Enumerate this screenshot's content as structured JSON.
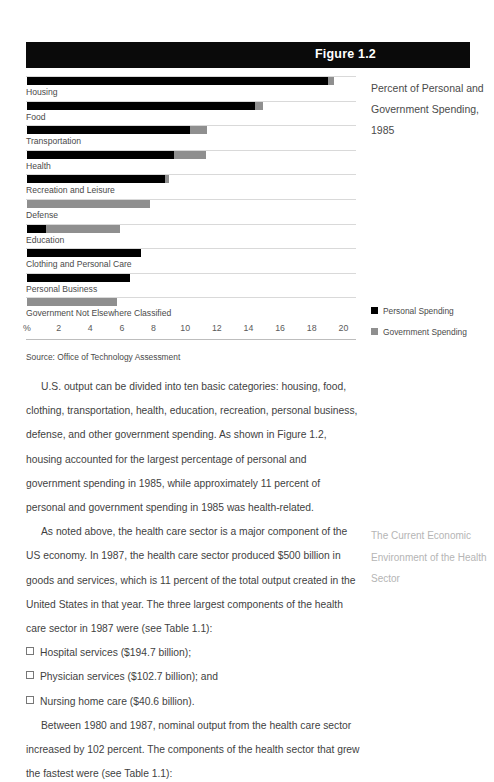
{
  "figure": {
    "header_label": "Figure 1.2",
    "caption": "Percent of Personal and Government Spending, 1985",
    "source": "Source: Office of Technology Assessment",
    "colors": {
      "personal": "#000000",
      "government": "#8f8f8f",
      "header_bar": "#0a0a0a",
      "rule": "#d9d9d9"
    },
    "legend": [
      {
        "label": "Personal Spending",
        "color": "#000000",
        "swatch": "square-swatch-personal"
      },
      {
        "label": "Government Spending",
        "color": "#8f8f8f",
        "swatch": "square-swatch-government"
      }
    ]
  },
  "chart_data": {
    "type": "bar",
    "orientation": "horizontal",
    "title": "Percent of Personal and Government Spending, 1985",
    "xlabel": "%",
    "ylabel": "",
    "xlim": [
      0,
      20
    ],
    "xticks": [
      "%",
      "2",
      "4",
      "6",
      "8",
      "10",
      "12",
      "14",
      "16",
      "18",
      "20"
    ],
    "xtick_values": [
      0,
      2,
      4,
      6,
      8,
      10,
      12,
      14,
      16,
      18,
      20
    ],
    "grid": false,
    "legend_position": "right",
    "stacked": true,
    "categories": [
      "Housing",
      "Food",
      "Transportation",
      "Health",
      "Recreation and Leisure",
      "Defense",
      "Education",
      "Clothing and Personal Care",
      "Personal Business",
      "Government Not Elsewhere Classified"
    ],
    "series": [
      {
        "name": "Personal Spending",
        "color": "#000000",
        "values": [
          19.0,
          14.4,
          10.3,
          9.3,
          8.7,
          0.0,
          1.2,
          7.2,
          6.5,
          0.0
        ]
      },
      {
        "name": "Government Spending",
        "color": "#8f8f8f",
        "values": [
          0.4,
          0.5,
          1.1,
          2.0,
          0.3,
          7.8,
          4.7,
          0.0,
          0.0,
          5.7
        ]
      }
    ]
  },
  "body": {
    "paragraphs": [
      "U.S. output can be divided into ten basic categories: housing, food, clothing, transportation, health, education, recreation, personal business, defense, and other government spending. As shown in Figure 1.2, housing accounted for the largest percentage of personal and government spending in 1985, while approximately 11 percent of personal and government spending in 1985 was health-related.",
      "As noted above, the health care sector is a major component of the US economy. In 1987, the health care sector produced $500 billion in goods and services, which is 11 percent of the total output created in the United States in that year. The three largest components of the health care sector in 1987 were (see Table 1.1):"
    ],
    "bullets": [
      "Hospital services ($194.7 billion);",
      "Physician services ($102.7 billion); and",
      "Nursing home care ($40.6 billion)."
    ],
    "closing_paragraph": "Between 1980 and 1987, nominal output from the health care sector increased by 102 percent. The components of the health sector that grew the fastest were (see Table 1.1):"
  },
  "running_head": {
    "text": "The Current Economic Environment of the Health Sector"
  }
}
